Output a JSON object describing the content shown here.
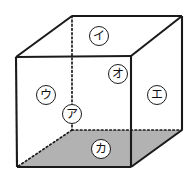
{
  "figure": {
    "type": "cube-diagram",
    "title": "",
    "background_color": "#ffffff",
    "edge_color": "#1a1a1a",
    "hidden_edge_style": "dotted",
    "shaded_face_color": "#b2b2b2",
    "visible_face_color": "#ffffff"
  },
  "labels": [
    {
      "id": "label-i",
      "text": "イ",
      "x": 99,
      "y": 36,
      "face": "top-face"
    },
    {
      "id": "label-o",
      "text": "オ",
      "x": 118,
      "y": 74,
      "face": "front-right-edge-upper"
    },
    {
      "id": "label-u",
      "text": "ウ",
      "x": 46,
      "y": 95,
      "face": "front-face"
    },
    {
      "id": "label-a",
      "text": "ア",
      "x": 72,
      "y": 114,
      "face": "hidden-vertical-edge"
    },
    {
      "id": "label-e",
      "text": "エ",
      "x": 157,
      "y": 95,
      "face": "right-face"
    },
    {
      "id": "label-ka",
      "text": "カ",
      "x": 101,
      "y": 149,
      "face": "bottom-face"
    }
  ],
  "geometry": {
    "front_top_left": {
      "x": 16,
      "y": 57
    },
    "front_top_right": {
      "x": 131,
      "y": 56
    },
    "front_bottom_right": {
      "x": 131,
      "y": 167
    },
    "front_bottom_left": {
      "x": 17,
      "y": 167
    },
    "back_top_left": {
      "x": 72,
      "y": 16
    },
    "back_top_right": {
      "x": 182,
      "y": 16
    },
    "back_bottom_right": {
      "x": 182,
      "y": 130
    },
    "back_bottom_left": {
      "x": 72,
      "y": 130
    }
  }
}
